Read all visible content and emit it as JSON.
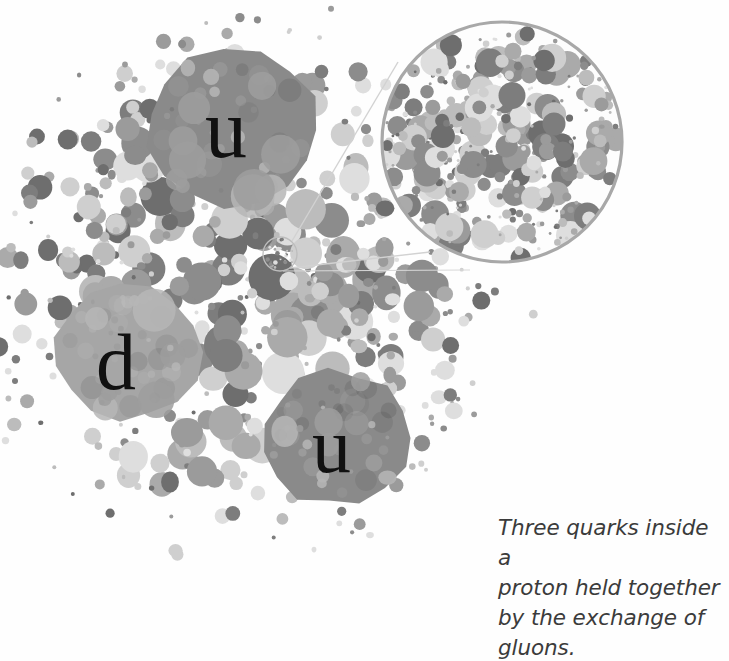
{
  "figure": {
    "caption": "Three quarks inside a\nproton held together\nby the exchange of\ngluons.",
    "caption_lines": [
      "Three quarks inside a",
      "proton held together",
      "by the exchange of",
      "gluons."
    ],
    "background_color": "#ffffff",
    "caption_color": "#3b3b3b"
  },
  "quarks": [
    {
      "id": "u1",
      "label": "u",
      "name": "up-quark",
      "color": "#8a8a8a",
      "cx": 233,
      "cy": 130,
      "rx": 86,
      "ry": 79
    },
    {
      "id": "d",
      "label": "d",
      "name": "down-quark",
      "color": "#a6a6a6",
      "cx": 128,
      "cy": 352,
      "rx": 72,
      "ry": 66
    },
    {
      "id": "u2",
      "label": "u",
      "name": "up-quark",
      "color": "#8a8a8a",
      "cx": 336,
      "cy": 438,
      "rx": 73,
      "ry": 67
    }
  ],
  "magnifier": {
    "name": "magnified-gluon-field",
    "border_color": "#a8a8a8",
    "fill_color": "#fdfdfd",
    "cx": 502,
    "cy": 142,
    "r": 122,
    "source_circle": {
      "cx": 280,
      "cy": 254,
      "r": 17,
      "border_color": "#b9b9b9"
    },
    "connector_color": "#cfcfcf"
  },
  "gluon_cloud": {
    "name": "gluon-dot-cloud",
    "description": "Dense cloud of gray dots representing gluons surrounding the three quarks",
    "palette": [
      "#6e6e6e",
      "#7d7d7d",
      "#8c8c8c",
      "#9b9b9b",
      "#aaaaaa",
      "#bcbcbc",
      "#cfcfcf",
      "#dedede"
    ],
    "center": {
      "cx": 245,
      "cy": 285
    },
    "radius": 290
  },
  "chart_data": {
    "type": "scatter",
    "xlabel": "",
    "ylabel": "",
    "legend": [
      "up quark (u)",
      "up quark (u)",
      "down quark (d)",
      "gluons"
    ],
    "series": [
      {
        "name": "quarks",
        "values": [
          {
            "label": "u",
            "x": 233,
            "y": 130,
            "r": 82
          },
          {
            "label": "d",
            "x": 128,
            "y": 352,
            "r": 69
          },
          {
            "label": "u",
            "x": 336,
            "y": 438,
            "r": 70
          }
        ]
      },
      {
        "name": "gluons",
        "count": 520,
        "note": "gray dots of radius 2-22 px filling the proton volume"
      }
    ]
  }
}
